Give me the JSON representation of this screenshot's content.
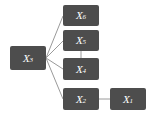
{
  "diagram": {
    "type": "graph",
    "background_color": "#ffffff",
    "node_fill_color": "#4d4d4d",
    "node_text_color": "#ffffff",
    "edge_color": "#9a9a9a",
    "nodes": [
      {
        "id": "X3",
        "variable": "X",
        "subscript": "3",
        "label": "X3",
        "x": 10,
        "y": 46,
        "w": 36,
        "h": 24
      },
      {
        "id": "X6",
        "variable": "X",
        "subscript": "6",
        "label": "X6",
        "x": 63,
        "y": 5,
        "w": 36,
        "h": 21
      },
      {
        "id": "X5",
        "variable": "X",
        "subscript": "5",
        "label": "X5",
        "x": 63,
        "y": 30,
        "w": 36,
        "h": 21
      },
      {
        "id": "X4",
        "variable": "X",
        "subscript": "4",
        "label": "X4",
        "x": 63,
        "y": 58,
        "w": 36,
        "h": 22
      },
      {
        "id": "X2",
        "variable": "X",
        "subscript": "2",
        "label": "X2",
        "x": 63,
        "y": 88,
        "w": 36,
        "h": 22
      },
      {
        "id": "X1",
        "variable": "X",
        "subscript": "1",
        "label": "X1",
        "x": 110,
        "y": 88,
        "w": 36,
        "h": 22
      }
    ],
    "edges": [
      {
        "from": "X3",
        "to": "X6",
        "x1": 46,
        "y1": 58,
        "x2": 63,
        "y2": 16
      },
      {
        "from": "X3",
        "to": "X5",
        "x1": 46,
        "y1": 58,
        "x2": 63,
        "y2": 41
      },
      {
        "from": "X3",
        "to": "X4",
        "x1": 46,
        "y1": 58,
        "x2": 63,
        "y2": 69
      },
      {
        "from": "X3",
        "to": "X2",
        "x1": 46,
        "y1": 58,
        "x2": 63,
        "y2": 99
      },
      {
        "from": "X5",
        "to": "X4",
        "x1": 81,
        "y1": 51,
        "x2": 81,
        "y2": 58
      },
      {
        "from": "X2",
        "to": "X1",
        "x1": 99,
        "y1": 99,
        "x2": 110,
        "y2": 99
      }
    ]
  }
}
